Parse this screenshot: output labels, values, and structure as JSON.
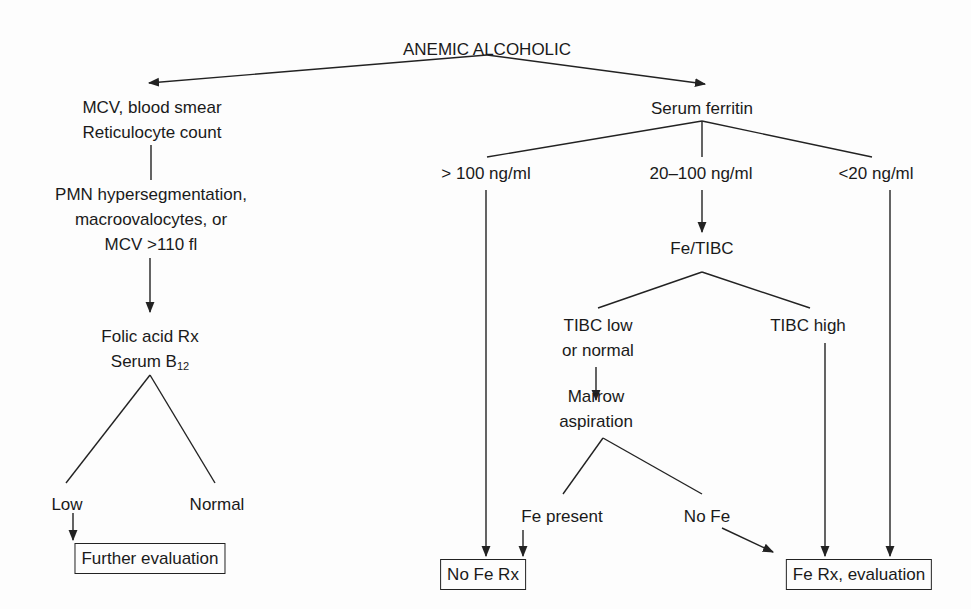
{
  "title": "ANEMIC ALCOHOLIC",
  "left_branch": {
    "initial_tests": [
      "MCV, blood smear",
      "Reticulocyte count"
    ],
    "findings": [
      "PMN hypersegmentation,",
      "macroovalocytes, or",
      "MCV >110 fl"
    ],
    "treatment": {
      "line1": "Folic acid Rx",
      "line2_base": "Serum B",
      "line2_sub": "12"
    },
    "outcomes": {
      "low": "Low",
      "normal": "Normal"
    },
    "terminal": "Further evaluation"
  },
  "right_branch": {
    "test": "Serum ferritin",
    "ranges": {
      "high": "> 100 ng/ml",
      "mid": "20–100 ng/ml",
      "low": "<20 ng/ml"
    },
    "iron_study": "Fe/TIBC",
    "tibc_results": {
      "low_normal": [
        "TIBC low",
        "or normal"
      ],
      "high": "TIBC high"
    },
    "marrow": [
      "Marrow",
      "aspiration"
    ],
    "marrow_results": {
      "present": "Fe present",
      "absent": "No Fe"
    },
    "terminals": {
      "no_fe_rx": "No Fe Rx",
      "fe_rx": "Fe Rx, evaluation"
    }
  },
  "colors": {
    "line": "#222222",
    "text": "#1a1a1a",
    "background": "#fdfdfd"
  }
}
